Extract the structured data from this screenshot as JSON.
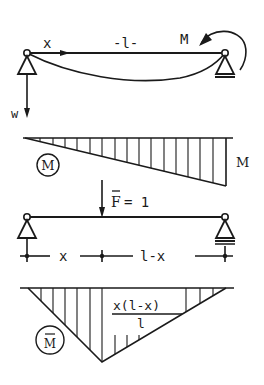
{
  "diagram": {
    "beam1": {
      "coord_label": "x",
      "span_label": "-l-",
      "moment_label": "M",
      "load_label": "w"
    },
    "moment_diagram": {
      "circle_label": "M",
      "end_value_label": "M"
    },
    "beam2": {
      "force_label": "F",
      "force_value": "= 1",
      "dim_left": "x",
      "dim_right": "l-x"
    },
    "unit_moment_diagram": {
      "circle_label": "M",
      "peak_numerator": "x(l-x)",
      "peak_denominator": "l"
    },
    "colors": {
      "ink": "#1a1a1a",
      "background": "#ffffff"
    }
  }
}
